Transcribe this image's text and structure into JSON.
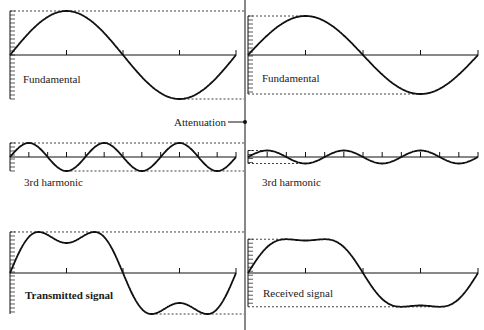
{
  "labels": {
    "top_left": "Fundamental",
    "top_right": "Fundamental",
    "mid_left": "3rd harmonic",
    "mid_right": "3rd harmonic",
    "bottom_left": "Transmitted signal",
    "bottom_right": "Received signal",
    "attenuation": "Attenuation"
  },
  "colors": {
    "stroke": "#111111",
    "background": "#ffffff"
  },
  "panels": [
    {
      "id": "fund-tx",
      "x0": 10,
      "x1": 236,
      "axis": 55,
      "amp": 44,
      "harmonic": 1,
      "cycles": 1,
      "a3": 0,
      "label_key": "top_left"
    },
    {
      "id": "fund-rx",
      "x0": 248,
      "x1": 478,
      "axis": 55,
      "amp": 39,
      "harmonic": 1,
      "cycles": 1,
      "a3": 0,
      "label_key": "top_right"
    },
    {
      "id": "h3-tx",
      "x0": 10,
      "x1": 236,
      "axis": 157,
      "amp": 14,
      "harmonic": 3,
      "cycles": 1,
      "a3": 0,
      "label_key": "mid_left"
    },
    {
      "id": "h3-rx",
      "x0": 248,
      "x1": 478,
      "axis": 157,
      "amp": 6.5,
      "harmonic": 3,
      "cycles": 1,
      "a3": 0,
      "label_key": "mid_right"
    },
    {
      "id": "sum-tx",
      "x0": 10,
      "x1": 236,
      "axis": 273,
      "amp": 44,
      "harmonic": 0,
      "cycles": 1,
      "a3": 14,
      "label_key": "bottom_left"
    },
    {
      "id": "sum-rx",
      "x0": 248,
      "x1": 478,
      "axis": 273,
      "amp": 39,
      "harmonic": 0,
      "cycles": 1,
      "a3": 6.5,
      "label_key": "bottom_right"
    }
  ]
}
